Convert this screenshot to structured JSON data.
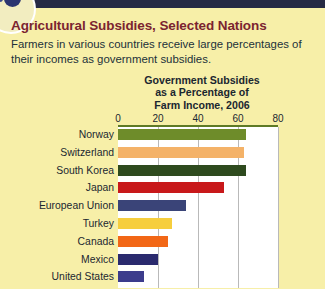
{
  "header": {
    "title": "Agricultural Subsidies, Selected Nations",
    "intro": "Farmers in various countries receive large percentages of their incomes as government subsidies.",
    "title_color": "#7B2430",
    "band_color": "#262A44",
    "background_color": "#F7EFA8"
  },
  "chart_data": {
    "type": "bar",
    "orientation": "horizontal",
    "title": "Government Subsidies as a Percentage of Farm Income, 2006",
    "title_lines": [
      "Government Subsidies",
      "as a Percentage of",
      "Farm Income, 2006"
    ],
    "xlabel": "",
    "ylabel": "",
    "xlim": [
      0,
      80
    ],
    "ticks": [
      0,
      20,
      40,
      60,
      80
    ],
    "tick_labels": [
      "0",
      "20",
      "40",
      "60",
      "80"
    ],
    "grid": true,
    "legend": "none",
    "plot_background": "#FFFFFF",
    "categories": [
      "Norway",
      "Switzerland",
      "South Korea",
      "Japan",
      "European Union",
      "Turkey",
      "Canada",
      "Mexico",
      "United States"
    ],
    "values": [
      64,
      63,
      64,
      53,
      34,
      27,
      25,
      20,
      13
    ],
    "colors": [
      "#6E8C2A",
      "#F4B268",
      "#2E4A1E",
      "#C8181A",
      "#3A4478",
      "#F6CE3D",
      "#F26716",
      "#2A2A6E",
      "#3C3C8C"
    ]
  }
}
